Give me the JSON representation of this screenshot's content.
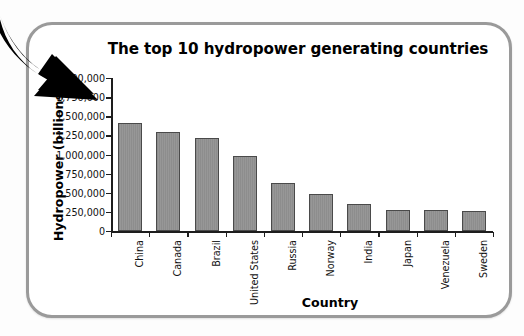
{
  "panel": {
    "border_color": "#9a9a9a",
    "background": "#ffffff"
  },
  "decorations": {
    "arrow": {
      "name": "black-curved-arrow",
      "color": "#000000",
      "direction": "down-right"
    }
  },
  "chart_data": {
    "type": "bar",
    "title": "The top 10 hydropower generating countries",
    "xlabel": "Country",
    "ylabel": "Hydropower (billions kJ)",
    "categories": [
      "China",
      "Canada",
      "Brazil",
      "United States",
      "Russia",
      "Norway",
      "India",
      "Japan",
      "Venezuela",
      "Sweden"
    ],
    "values": [
      1415000,
      1295000,
      1210000,
      985000,
      630000,
      490000,
      355000,
      280000,
      272000,
      265000
    ],
    "ylim": [
      0,
      2000000
    ],
    "ytick_values": [
      0,
      250000,
      500000,
      750000,
      1000000,
      1250000,
      1500000,
      1750000,
      2000000
    ],
    "ytick_labels": [
      "0",
      "250,000",
      "500,000",
      "750,000",
      "1,000,000",
      "1,250,000",
      "1,500,000",
      "1,750,000",
      "2,000,000"
    ],
    "grid": false,
    "legend": null,
    "bar_fill_color": "#8d8d8d",
    "bar_edge_color": "#4a4a4a",
    "axis_color": "#1d1d1d",
    "category_label_rotation": -90
  }
}
